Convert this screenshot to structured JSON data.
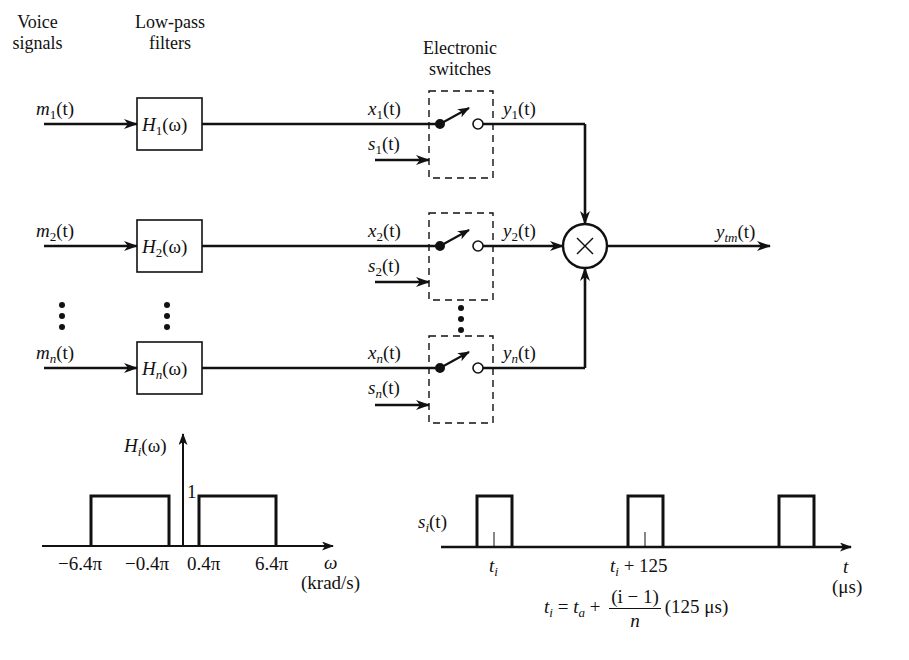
{
  "headers": {
    "voice": [
      "Voice",
      "signals"
    ],
    "filters": [
      "Low-pass",
      "filters"
    ],
    "switches": [
      "Electronic",
      "switches"
    ]
  },
  "channels": [
    {
      "m": "m",
      "m_sub": "1",
      "H": "H",
      "H_sub": "1",
      "x": "x",
      "x_sub": "1",
      "s": "s",
      "s_sub": "1",
      "y": "y",
      "y_sub": "1"
    },
    {
      "m": "m",
      "m_sub": "2",
      "H": "H",
      "H_sub": "2",
      "x": "x",
      "x_sub": "2",
      "s": "s",
      "s_sub": "2",
      "y": "y",
      "y_sub": "2"
    },
    {
      "m": "m",
      "m_sub": "n",
      "H": "H",
      "H_sub": "n",
      "x": "x",
      "x_sub": "n",
      "s": "s",
      "s_sub": "n",
      "y": "y",
      "y_sub": "n"
    }
  ],
  "common": {
    "of_t": "(t)",
    "of_omega": "(ω)"
  },
  "multiplier": {
    "symbol": "×"
  },
  "output": {
    "y": "y",
    "y_sub": "tm",
    "of_t": "(t)"
  },
  "filter_plot": {
    "ylabel": "H",
    "ylabel_sub": "i",
    "ylabel_arg": "(ω)",
    "level_label": "1",
    "ticks": [
      "−6.4π",
      "−0.4π",
      "0.4π",
      "6.4π"
    ],
    "xlabel": "ω",
    "xunit": "(krad/s)"
  },
  "pulse_plot": {
    "ylabel": "s",
    "ylabel_sub": "i",
    "ylabel_arg": "(t)",
    "tick1": "t",
    "tick1_sub": "i",
    "tick2": "t",
    "tick2_sub": "i",
    "tick2_suffix": " + 125",
    "xlabel": "t",
    "xunit": "(μs)"
  },
  "equation": {
    "lhs": "t",
    "lhs_sub": "i",
    "eq": " = ",
    "ta": "t",
    "ta_sub": "a",
    "plus": " + ",
    "num": "(i − 1)",
    "den": "n",
    "tail": "(125 μs)"
  }
}
